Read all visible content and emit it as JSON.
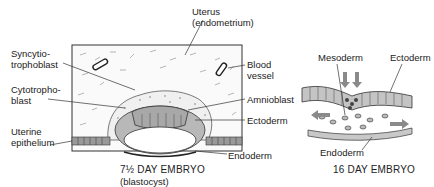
{
  "left_panel": {
    "labels": {
      "uterus": "Uterus",
      "uterus_sub": "(endometrium)",
      "syncytio_1": "Syncytio-",
      "syncytio_2": "trophoblast",
      "cytotropho_1": "Cytotropho-",
      "cytotropho_2": "blast",
      "uterine_1": "Uterine",
      "uterine_2": "epithelium",
      "blood_1": "Blood",
      "blood_2": "vessel",
      "amnioblast": "Amnioblast",
      "ectoderm": "Ectoderm",
      "endoderm": "Endoderm"
    },
    "caption": "7½ DAY EMBRYO",
    "caption_sub": "(blastocyst)"
  },
  "right_panel": {
    "labels": {
      "mesoderm": "Mesoderm",
      "ectoderm": "Ectoderm",
      "endoderm": "Endoderm"
    },
    "caption": "16 DAY EMBRYO"
  },
  "colors": {
    "ink": "#222222",
    "cell_fill": "#b8b8b8",
    "dark_cell": "#555555",
    "arrow": "#8a8a8a"
  }
}
